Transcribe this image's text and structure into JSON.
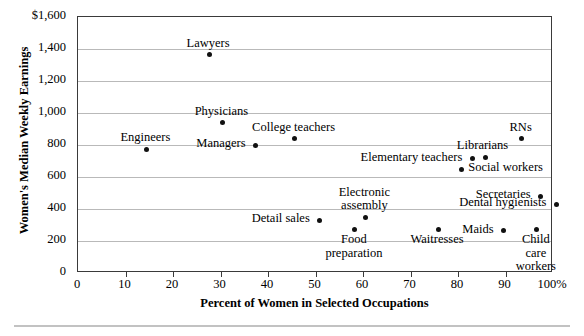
{
  "chart_data": {
    "type": "scatter",
    "title": "",
    "xlabel": "Percent of Women in Selected Occupations",
    "ylabel": "Women's Median Weekly Earnings",
    "xlim": [
      0,
      100
    ],
    "ylim": [
      0,
      1600
    ],
    "grid": true,
    "legend": "none",
    "x_ticks": [
      "0",
      "10",
      "20",
      "30",
      "40",
      "50",
      "60",
      "70",
      "80",
      "90",
      "100%"
    ],
    "x_tick_values": [
      0,
      10,
      20,
      30,
      40,
      50,
      60,
      70,
      80,
      90,
      100
    ],
    "y_ticks": [
      "0",
      "200",
      "400",
      "600",
      "800",
      "1,000",
      "1,200",
      "1,400",
      "$1,600"
    ],
    "y_tick_values": [
      0,
      200,
      400,
      600,
      800,
      1000,
      1200,
      1400,
      1600
    ],
    "points": [
      {
        "label": "Lawyers",
        "x": 27.6,
        "y": 1363,
        "label_pos": "above",
        "label_dx": 0,
        "label_dy": -17
      },
      {
        "label": "Physicians",
        "x": 30.4,
        "y": 938,
        "label_pos": "above",
        "label_dx": 0,
        "label_dy": -17
      },
      {
        "label": "Engineers",
        "x": 14.4,
        "y": 775,
        "label_pos": "above",
        "label_dx": 0,
        "label_dy": -17
      },
      {
        "label": "Managers",
        "x": 37.4,
        "y": 800,
        "label_pos": "left",
        "label_dx": -9,
        "label_dy": -7
      },
      {
        "label": "College teachers",
        "x": 45.6,
        "y": 838,
        "label_pos": "above",
        "label_dx": 0,
        "label_dy": -17
      },
      {
        "label": "RNs",
        "x": 93.4,
        "y": 838,
        "label_pos": "above",
        "label_dx": 0,
        "label_dy": -17
      },
      {
        "label": "Librarians",
        "x": 85.8,
        "y": 725,
        "label_pos": "above",
        "label_dx": -2,
        "label_dy": -17
      },
      {
        "label": "Elementary teachers",
        "x": 83.0,
        "y": 713,
        "label_pos": "left",
        "label_dx": -9,
        "label_dy": -7
      },
      {
        "label": "Social workers",
        "x": 80.7,
        "y": 650,
        "label_pos": "right",
        "label_dx": 8,
        "label_dy": -7
      },
      {
        "label": "Secretaries",
        "x": 97.4,
        "y": 481,
        "label_pos": "left",
        "label_dx": -9,
        "label_dy": -7
      },
      {
        "label": "Dental hygienists",
        "x": 100.7,
        "y": 431,
        "label_pos": "left",
        "label_dx": -9,
        "label_dy": -7
      },
      {
        "label": "Detail sales",
        "x": 50.9,
        "y": 331,
        "label_pos": "left",
        "label_dx": -9,
        "label_dy": -7
      },
      {
        "label": "Electronic\nassembly",
        "x": 60.5,
        "y": 344,
        "label_pos": "above",
        "label_dx": 0,
        "label_dy": -31
      },
      {
        "label": "Food\npreparation",
        "x": 58.3,
        "y": 275,
        "label_pos": "below",
        "label_dx": 0,
        "label_dy": 5
      },
      {
        "label": "Waitresses",
        "x": 75.8,
        "y": 275,
        "label_pos": "below",
        "label_dx": 0,
        "label_dy": 5
      },
      {
        "label": "Maids",
        "x": 89.6,
        "y": 263,
        "label_pos": "left",
        "label_dx": -9,
        "label_dy": -7
      },
      {
        "label": "Child\ncare\nworkers",
        "x": 96.6,
        "y": 275,
        "label_pos": "below",
        "label_dx": 0,
        "label_dy": 5
      }
    ]
  }
}
